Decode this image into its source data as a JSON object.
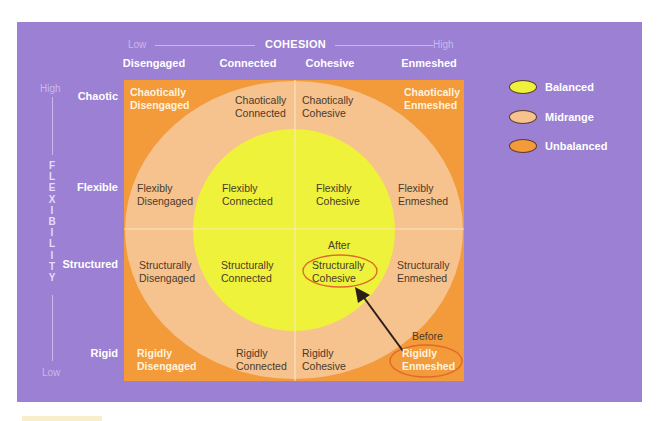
{
  "colors": {
    "panel": "#9b80d3",
    "unbalanced": "#f39a3a",
    "midrange": "#f6c28e",
    "balanced": "#eef23a",
    "highlight_ring": "#e0692a",
    "arrow": "#2a1f1a"
  },
  "cohesion_axis": {
    "low": "Low",
    "title": "COHESION",
    "high": "High",
    "levels": [
      "Disengaged",
      "Connected",
      "Cohesive",
      "Enmeshed"
    ]
  },
  "flexibility_axis": {
    "high": "High",
    "title_letters": [
      "F",
      "L",
      "E",
      "X",
      "I",
      "B",
      "I",
      "L",
      "I",
      "T",
      "Y"
    ],
    "low": "Low",
    "levels": [
      "Chaotic",
      "Flexible",
      "Structured",
      "Rigid"
    ]
  },
  "cells": [
    {
      "row": "Chaotic",
      "type": "unbalanced",
      "lines": [
        "Chaotically",
        "Disengaged"
      ]
    },
    {
      "row": "Chaotic",
      "type": "midrange",
      "lines": [
        "Chaotically",
        "Connected"
      ]
    },
    {
      "row": "Chaotic",
      "type": "midrange",
      "lines": [
        "Chaotically",
        "Cohesive"
      ]
    },
    {
      "row": "Chaotic",
      "type": "unbalanced",
      "lines": [
        "Chaotically",
        "Enmeshed"
      ]
    },
    {
      "row": "Flexible",
      "type": "midrange",
      "lines": [
        "Flexibly",
        "Disengaged"
      ]
    },
    {
      "row": "Flexible",
      "type": "balanced",
      "lines": [
        "Flexibly",
        "Connected"
      ]
    },
    {
      "row": "Flexible",
      "type": "balanced",
      "lines": [
        "Flexibly",
        "Cohesive"
      ]
    },
    {
      "row": "Flexible",
      "type": "midrange",
      "lines": [
        "Flexibly",
        "Enmeshed"
      ]
    },
    {
      "row": "Structured",
      "type": "midrange",
      "lines": [
        "Structurally",
        "Disengaged"
      ]
    },
    {
      "row": "Structured",
      "type": "balanced",
      "lines": [
        "Structurally",
        "Connected"
      ]
    },
    {
      "row": "Structured",
      "type": "balanced",
      "lines": [
        "Structurally",
        "Cohesive"
      ]
    },
    {
      "row": "Structured",
      "type": "midrange",
      "lines": [
        "Structurally",
        "Enmeshed"
      ]
    },
    {
      "row": "Rigid",
      "type": "unbalanced",
      "lines": [
        "Rigidly",
        "Disengaged"
      ]
    },
    {
      "row": "Rigid",
      "type": "midrange",
      "lines": [
        "Rigidly",
        "Connected"
      ]
    },
    {
      "row": "Rigid",
      "type": "midrange",
      "lines": [
        "Rigidly",
        "Cohesive"
      ]
    },
    {
      "row": "Rigid",
      "type": "unbalanced",
      "lines": [
        "Rigidly",
        "Enmeshed"
      ]
    }
  ],
  "annotations": {
    "after_label": "After",
    "after_cell": "Structurally Cohesive",
    "before_label": "Before",
    "before_cell": "Rigidly Enmeshed"
  },
  "legend": [
    {
      "label": "Balanced",
      "color": "#eef23a"
    },
    {
      "label": "Midrange",
      "color": "#f6c28e"
    },
    {
      "label": "Unbalanced",
      "color": "#f39a3a"
    }
  ]
}
